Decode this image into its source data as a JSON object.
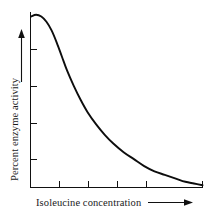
{
  "figure": {
    "background_color": "#ffffff",
    "curve_color": "#0d0d0d",
    "axis_color": "#111111"
  },
  "chart_data": {
    "type": "line",
    "title": "",
    "xlabel": "Isoleucine concentration",
    "ylabel": "Percent enzyme activity",
    "xlabel_arrow": "right-arrow",
    "ylabel_arrow": "up-arrow",
    "grid": false,
    "legend": null,
    "legend_position": "none",
    "xlim": [
      0,
      100
    ],
    "ylim": [
      0,
      100
    ],
    "x_tick_labels": [],
    "y_tick_labels": [],
    "x_tick_count": 5,
    "y_tick_count": 4,
    "x_tick_positions": [
      17,
      34,
      51,
      68,
      100
    ],
    "y_tick_positions": [
      22,
      43,
      64,
      85
    ],
    "series": [
      {
        "name": "Enzyme activity vs isoleucine",
        "x": [
          0,
          3,
          6,
          9,
          12,
          15,
          18,
          21,
          25,
          29,
          33,
          38,
          43,
          48,
          54,
          60,
          66,
          72,
          78,
          84,
          90,
          95,
          100
        ],
        "values": [
          98,
          99,
          98,
          95,
          90,
          83,
          75,
          67,
          58,
          50,
          43,
          36,
          30,
          25,
          20,
          16,
          12,
          9,
          7,
          5,
          3,
          2,
          1
        ]
      }
    ]
  }
}
